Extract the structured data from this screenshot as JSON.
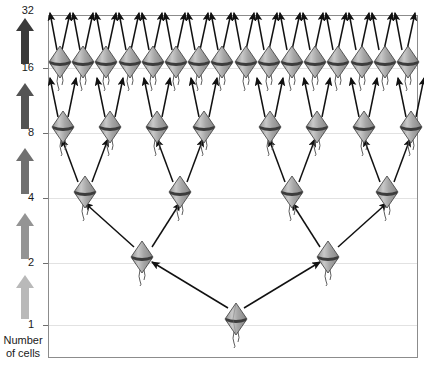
{
  "figure": {
    "type": "cell-division-diagram",
    "title": "",
    "background_color": "#ffffff",
    "frame_color": "#8c8c8c",
    "gridline_color": "#e2e2e2"
  },
  "axis": {
    "caption_line1": "Number",
    "caption_line2": "of cells",
    "tick_labels": [
      "32",
      "16",
      "8",
      "4",
      "2",
      "1"
    ],
    "tick_values": [
      32,
      16,
      8,
      4,
      2,
      1
    ],
    "tick_y": [
      10,
      68,
      133,
      198,
      263,
      325
    ],
    "arrow_colors": [
      "#3a3a3a",
      "#545454",
      "#707070",
      "#949494",
      "#b9b9b9"
    ],
    "arrow_count": 5
  },
  "chart_data": {
    "type": "diagram",
    "title": "Number of cells",
    "xlabel": "",
    "ylabel": "Number of cells",
    "categories": [
      "1",
      "2",
      "4",
      "8",
      "16",
      "32"
    ],
    "values": [
      1,
      2,
      4,
      8,
      16,
      32
    ],
    "grid": true,
    "legend": "none",
    "rows": [
      {
        "label": "32",
        "cell_count": 0,
        "arrows_up": 32,
        "y": 10
      },
      {
        "label": "16",
        "cell_count": 16,
        "arrows_up": 0,
        "y": 68
      },
      {
        "label": "8",
        "cell_count": 8,
        "arrows_up": 0,
        "y": 133
      },
      {
        "label": "4",
        "cell_count": 4,
        "arrows_up": 0,
        "y": 198
      },
      {
        "label": "2",
        "cell_count": 2,
        "arrows_up": 0,
        "y": 263
      },
      {
        "label": "1",
        "cell_count": 1,
        "arrows_up": 0,
        "y": 325
      }
    ]
  },
  "cell_glyph": {
    "name": "flagellated-cell",
    "body_fill": "#b0b0b0",
    "body_stroke": "#4a4a4a",
    "band_fill": "#3c3c3c",
    "tail_stroke": "#4a4a4a"
  },
  "arrows": {
    "color": "#111111",
    "description": "division arrows pointing upward from each parent cell to two daughter cells"
  }
}
